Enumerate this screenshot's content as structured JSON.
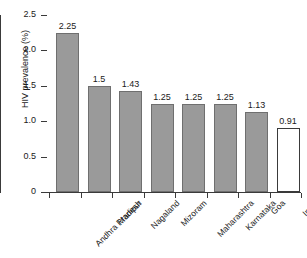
{
  "chart_data": {
    "type": "bar",
    "title": "",
    "xlabel": "",
    "ylabel": "HIV prevalence (%)",
    "categories": [
      "Andhra Pradesh",
      "Manipur",
      "Nagaland",
      "Mizoram",
      "Maharashtra",
      "Karnataka",
      "Goa",
      "India"
    ],
    "values": [
      2.25,
      1.5,
      1.43,
      1.25,
      1.25,
      1.25,
      1.13,
      0.91
    ],
    "value_labels": [
      "2.25",
      "1.5",
      "1.43",
      "1.25",
      "1.25",
      "1.25",
      "1.13",
      "0.91"
    ],
    "ylim": [
      0,
      2.5
    ],
    "ytick_labels": [
      "0",
      "0.5",
      "1.0",
      "1.5",
      "2.0",
      "2.5"
    ],
    "ytick_values": [
      0,
      0.5,
      1.0,
      1.5,
      2.0,
      2.5
    ],
    "grid": false,
    "legend": null,
    "bar_styles": [
      "filled",
      "filled",
      "filled",
      "filled",
      "filled",
      "filled",
      "filled",
      "hollow"
    ],
    "colors": {
      "bar_fill": "#9a9a9a",
      "bar_edge": "#6f6f6f",
      "highlight_fill": "#ffffff",
      "highlight_edge": "#3a3a3a",
      "axis": "#3a3a3a",
      "text": "#1a1a1a",
      "background": "#ffffff"
    }
  }
}
